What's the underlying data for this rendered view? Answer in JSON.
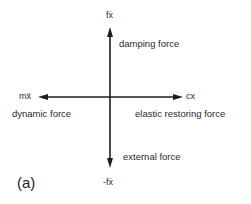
{
  "diagram": {
    "axes": {
      "up": {
        "symbol": "fẋ",
        "label": "damping force"
      },
      "down": {
        "symbol": "-fẋ",
        "label": "external force"
      },
      "left": {
        "symbol": "mẍ",
        "label": "dynamic force"
      },
      "right": {
        "symbol": "cx",
        "label": "elastic restoring force"
      }
    },
    "caption": "(a)",
    "colors": {
      "line": "#1e1e1e",
      "text": "#2a2a2a",
      "background": "#ffffff"
    }
  }
}
